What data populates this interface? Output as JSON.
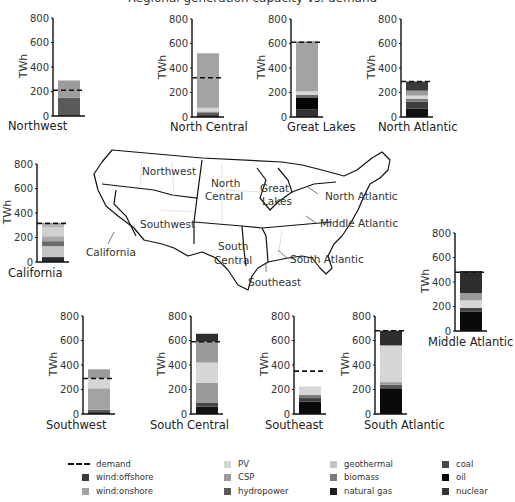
{
  "title": "Regional generation capacity vs. demand",
  "legend": {
    "demand": {
      "label": "demand",
      "type": "dashed-line"
    },
    "items": [
      {
        "key": "wind_offshore",
        "label": "wind:offshore",
        "color": "#3a3a3a"
      },
      {
        "key": "wind_onshore",
        "label": "wind:onshore",
        "color": "#a3a3a3"
      },
      {
        "key": "pv",
        "label": "PV",
        "color": "#d6d6d6"
      },
      {
        "key": "csp",
        "label": "CSP",
        "color": "#9a9a9a"
      },
      {
        "key": "hydropower",
        "label": "hydropower",
        "color": "#5a5a5a"
      },
      {
        "key": "geothermal",
        "label": "geothermal",
        "color": "#c4c4c4"
      },
      {
        "key": "biomass",
        "label": "biomass",
        "color": "#7a7a7a"
      },
      {
        "key": "natural_gas",
        "label": "natural gas",
        "color": "#1c1c1c"
      },
      {
        "key": "coal",
        "label": "coal",
        "color": "#454545"
      },
      {
        "key": "oil",
        "label": "oil",
        "color": "#050505"
      },
      {
        "key": "nuclear",
        "label": "nuclear",
        "color": "#333333"
      }
    ]
  },
  "map": {
    "labels": [
      "Northwest",
      "North Central",
      "Great Lakes",
      "North Atlantic",
      "Middle Atlantic",
      "South Atlantic",
      "Southeast",
      "South Central",
      "Southwest",
      "California"
    ]
  },
  "axis": {
    "ylabel": "TWh",
    "ticks": [
      0,
      200,
      400,
      600,
      800
    ],
    "ylim": [
      0,
      800
    ]
  },
  "chart_data": {
    "type": "bar",
    "stacked": true,
    "title": "",
    "ylabel": "TWh",
    "ylim": [
      0,
      800
    ],
    "ticks": [
      0,
      200,
      400,
      600,
      800
    ],
    "series_order": [
      "nuclear",
      "oil",
      "coal",
      "natural_gas",
      "biomass",
      "geothermal",
      "hydropower",
      "csp",
      "pv",
      "wind_onshore",
      "wind_offshore"
    ],
    "regions": [
      {
        "name": "Northwest",
        "demand": 210,
        "segments": [
          {
            "key": "hydropower",
            "value": 150,
            "color": "#5a5a5a"
          },
          {
            "key": "wind_onshore",
            "value": 140,
            "color": "#9c9c9c"
          }
        ]
      },
      {
        "name": "North Central",
        "demand": 320,
        "segments": [
          {
            "key": "natural_gas",
            "value": 15,
            "color": "#1c1c1c"
          },
          {
            "key": "hydropower",
            "value": 20,
            "color": "#5a5a5a"
          },
          {
            "key": "biomass",
            "value": 10,
            "color": "#7a7a7a"
          },
          {
            "key": "pv",
            "value": 30,
            "color": "#d6d6d6"
          },
          {
            "key": "wind_onshore",
            "value": 445,
            "color": "#a3a3a3"
          }
        ]
      },
      {
        "name": "Great Lakes",
        "demand": 610,
        "segments": [
          {
            "key": "nuclear",
            "value": 60,
            "color": "#333333"
          },
          {
            "key": "oil",
            "value": 100,
            "color": "#050505"
          },
          {
            "key": "biomass",
            "value": 20,
            "color": "#6a6a6a"
          },
          {
            "key": "pv",
            "value": 30,
            "color": "#d6d6d6"
          },
          {
            "key": "wind_onshore",
            "value": 400,
            "color": "#a3a3a3"
          },
          {
            "key": "wind_offshore",
            "value": 5,
            "color": "#1c1c1c"
          }
        ]
      },
      {
        "name": "North Atlantic",
        "demand": 290,
        "segments": [
          {
            "key": "oil",
            "value": 70,
            "color": "#111111"
          },
          {
            "key": "coal",
            "value": 55,
            "color": "#3e3e3e"
          },
          {
            "key": "biomass",
            "value": 25,
            "color": "#7a7a7a"
          },
          {
            "key": "pv",
            "value": 25,
            "color": "#d6d6d6"
          },
          {
            "key": "csp",
            "value": 40,
            "color": "#9a9a9a"
          },
          {
            "key": "wind_offshore",
            "value": 75,
            "color": "#3a3a3a"
          }
        ]
      },
      {
        "name": "California",
        "demand": 315,
        "segments": [
          {
            "key": "natural_gas",
            "value": 40,
            "color": "#2a2a2a"
          },
          {
            "key": "geothermal",
            "value": 90,
            "color": "#c4c4c4"
          },
          {
            "key": "biomass",
            "value": 40,
            "color": "#6a6a6a"
          },
          {
            "key": "csp",
            "value": 40,
            "color": "#a8a8a8"
          },
          {
            "key": "pv",
            "value": 75,
            "color": "#d0d0d0"
          },
          {
            "key": "wind_onshore",
            "value": 25,
            "color": "#b6b6b6"
          },
          {
            "key": "wind_offshore",
            "value": 5,
            "color": "#3a3a3a"
          }
        ]
      },
      {
        "name": "Middle Atlantic",
        "demand": 480,
        "segments": [
          {
            "key": "oil",
            "value": 160,
            "color": "#0a0a0a"
          },
          {
            "key": "coal",
            "value": 30,
            "color": "#454545"
          },
          {
            "key": "pv",
            "value": 60,
            "color": "#d6d6d6"
          },
          {
            "key": "csp",
            "value": 60,
            "color": "#9a9a9a"
          },
          {
            "key": "wind_offshore",
            "value": 180,
            "color": "#2e2e2e"
          }
        ]
      },
      {
        "name": "Southwest",
        "demand": 290,
        "segments": [
          {
            "key": "natural_gas",
            "value": 15,
            "color": "#1c1c1c"
          },
          {
            "key": "hydropower",
            "value": 20,
            "color": "#5a5a5a"
          },
          {
            "key": "wind_onshore",
            "value": 175,
            "color": "#a3a3a3"
          },
          {
            "key": "pv",
            "value": 80,
            "color": "#d6d6d6"
          },
          {
            "key": "csp",
            "value": 75,
            "color": "#9a9a9a"
          }
        ]
      },
      {
        "name": "South Central",
        "demand": 590,
        "segments": [
          {
            "key": "oil",
            "value": 60,
            "color": "#111111"
          },
          {
            "key": "coal",
            "value": 30,
            "color": "#454545"
          },
          {
            "key": "wind_onshore",
            "value": 165,
            "color": "#9a9a9a"
          },
          {
            "key": "pv",
            "value": 165,
            "color": "#d6d6d6"
          },
          {
            "key": "csp",
            "value": 170,
            "color": "#9a9a9a"
          },
          {
            "key": "wind_offshore",
            "value": 65,
            "color": "#2e2e2e"
          }
        ]
      },
      {
        "name": "Southeast",
        "demand": 350,
        "segments": [
          {
            "key": "oil",
            "value": 100,
            "color": "#0a0a0a"
          },
          {
            "key": "coal",
            "value": 30,
            "color": "#3e3e3e"
          },
          {
            "key": "biomass",
            "value": 25,
            "color": "#7a7a7a"
          },
          {
            "key": "pv",
            "value": 70,
            "color": "#d6d6d6"
          }
        ]
      },
      {
        "name": "South Atlantic",
        "demand": 680,
        "segments": [
          {
            "key": "oil",
            "value": 210,
            "color": "#0a0a0a"
          },
          {
            "key": "biomass",
            "value": 30,
            "color": "#5a5a5a"
          },
          {
            "key": "geothermal",
            "value": 20,
            "color": "#9a9a9a"
          },
          {
            "key": "pv",
            "value": 300,
            "color": "#d6d6d6"
          },
          {
            "key": "wind_offshore",
            "value": 120,
            "color": "#2e2e2e"
          }
        ]
      }
    ]
  },
  "layout": {
    "charts": [
      {
        "region": 0,
        "x": 53,
        "y0": 116,
        "labelX": 8,
        "labelY": 119
      },
      {
        "region": 1,
        "x": 192,
        "y0": 117,
        "labelX": 170,
        "labelY": 120
      },
      {
        "region": 2,
        "x": 291,
        "y0": 117,
        "labelX": 287,
        "labelY": 120
      },
      {
        "region": 3,
        "x": 401,
        "y0": 117,
        "labelX": 378,
        "labelY": 120
      },
      {
        "region": 4,
        "x": 37,
        "y0": 262,
        "labelX": 8,
        "labelY": 266
      },
      {
        "region": 5,
        "x": 455,
        "y0": 331,
        "labelX": 428,
        "labelY": 335
      },
      {
        "region": 6,
        "x": 83,
        "y0": 414,
        "labelX": 46,
        "labelY": 418
      },
      {
        "region": 7,
        "x": 191,
        "y0": 414,
        "labelX": 150,
        "labelY": 418
      },
      {
        "region": 8,
        "x": 294,
        "y0": 414,
        "labelX": 265,
        "labelY": 418
      },
      {
        "region": 9,
        "x": 375,
        "y0": 414,
        "labelX": 364,
        "labelY": 418
      }
    ]
  }
}
